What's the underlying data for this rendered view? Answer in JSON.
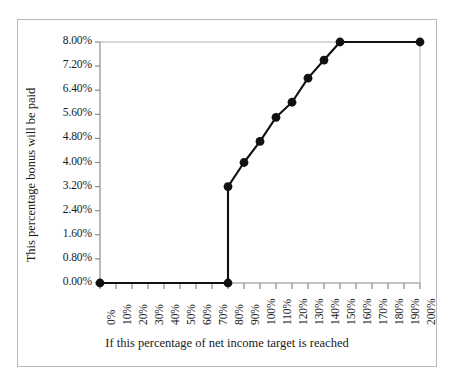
{
  "chart_data": {
    "type": "line",
    "title": "",
    "xlabel": "If this percentage of net income target is reached",
    "ylabel": "This percentage bonus will be paid",
    "xlim": [
      0,
      200
    ],
    "ylim": [
      0,
      8
    ],
    "grid": false,
    "legend": null,
    "x_tick_labels": [
      "0%",
      "10%",
      "20%",
      "30%",
      "40%",
      "50%",
      "60%",
      "70%",
      "80%",
      "90%",
      "100%",
      "110%",
      "120%",
      "130%",
      "140%",
      "150%",
      "160%",
      "170%",
      "180%",
      "190%",
      "200%"
    ],
    "x_tick_values": [
      0,
      10,
      20,
      30,
      40,
      50,
      60,
      70,
      80,
      90,
      100,
      110,
      120,
      130,
      140,
      150,
      160,
      170,
      180,
      190,
      200
    ],
    "y_tick_labels": [
      "0.00%",
      "0.80%",
      "1.60%",
      "2.40%",
      "3.20%",
      "4.00%",
      "4.80%",
      "5.60%",
      "6.40%",
      "7.20%",
      "8.00%"
    ],
    "y_tick_values": [
      0,
      0.8,
      1.6,
      2.4,
      3.2,
      4.0,
      4.8,
      5.6,
      6.4,
      7.2,
      8.0
    ],
    "series": [
      {
        "name": "Bonus payout schedule",
        "x": [
          0,
          80,
          80,
          90,
          100,
          110,
          120,
          130,
          140,
          150,
          200
        ],
        "values": [
          0.0,
          0.0,
          3.2,
          4.0,
          4.7,
          5.5,
          6.0,
          6.8,
          7.4,
          8.0,
          8.0
        ],
        "marker_x": [
          0,
          80,
          80,
          90,
          100,
          110,
          120,
          130,
          140,
          150,
          200
        ],
        "marker_values": [
          0.0,
          0.0,
          3.2,
          4.0,
          4.7,
          5.5,
          6.0,
          6.8,
          7.4,
          8.0,
          8.0
        ],
        "line_color": "#111111",
        "marker_color": "#111111"
      }
    ],
    "colors": {
      "line": "#111111",
      "marker": "#111111",
      "axis": "#8a8a8a",
      "frame": "#b9b9b9",
      "text": "#1a1a1a",
      "background": "#ffffff"
    }
  }
}
